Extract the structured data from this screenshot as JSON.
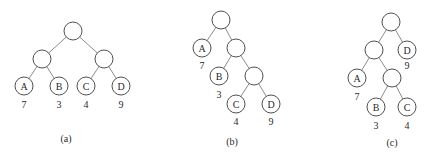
{
  "node_radius": 9,
  "trees": [
    {
      "id": "a",
      "caption": "(a)",
      "caption_pos": [
        66,
        138
      ],
      "nodes": [
        {
          "id": "a-root",
          "x": 73,
          "y": 31,
          "label": ""
        },
        {
          "id": "a-l",
          "x": 42,
          "y": 59,
          "label": ""
        },
        {
          "id": "a-r",
          "x": 104,
          "y": 59,
          "label": ""
        },
        {
          "id": "a-A",
          "x": 24,
          "y": 86,
          "label": "A",
          "weight": "7",
          "wx": 24,
          "wy": 104
        },
        {
          "id": "a-B",
          "x": 59,
          "y": 86,
          "label": "B",
          "weight": "3",
          "wx": 59,
          "wy": 104
        },
        {
          "id": "a-C",
          "x": 86,
          "y": 86,
          "label": "C",
          "weight": "4",
          "wx": 86,
          "wy": 104
        },
        {
          "id": "a-D",
          "x": 121,
          "y": 86,
          "label": "D",
          "weight": "9",
          "wx": 121,
          "wy": 104
        }
      ],
      "edges": [
        [
          "a-root",
          "a-l"
        ],
        [
          "a-root",
          "a-r"
        ],
        [
          "a-l",
          "a-A"
        ],
        [
          "a-l",
          "a-B"
        ],
        [
          "a-r",
          "a-C"
        ],
        [
          "a-r",
          "a-D"
        ]
      ]
    },
    {
      "id": "b",
      "caption": "(b)",
      "caption_pos": [
        232,
        141
      ],
      "nodes": [
        {
          "id": "b-root",
          "x": 221,
          "y": 20,
          "label": ""
        },
        {
          "id": "b-A",
          "x": 202,
          "y": 48,
          "label": "A",
          "weight": "7",
          "wx": 202,
          "wy": 65
        },
        {
          "id": "b-i1",
          "x": 236,
          "y": 48,
          "label": ""
        },
        {
          "id": "b-B",
          "x": 219,
          "y": 76,
          "label": "B",
          "weight": "3",
          "wx": 219,
          "wy": 94
        },
        {
          "id": "b-i2",
          "x": 254,
          "y": 76,
          "label": ""
        },
        {
          "id": "b-C",
          "x": 236,
          "y": 104,
          "label": "C",
          "weight": "4",
          "wx": 236,
          "wy": 121
        },
        {
          "id": "b-D",
          "x": 271,
          "y": 104,
          "label": "D",
          "weight": "9",
          "wx": 271,
          "wy": 121
        }
      ],
      "edges": [
        [
          "b-root",
          "b-A"
        ],
        [
          "b-root",
          "b-i1"
        ],
        [
          "b-i1",
          "b-B"
        ],
        [
          "b-i1",
          "b-i2"
        ],
        [
          "b-i2",
          "b-C"
        ],
        [
          "b-i2",
          "b-D"
        ]
      ]
    },
    {
      "id": "c",
      "caption": "(c)",
      "caption_pos": [
        392,
        142
      ],
      "nodes": [
        {
          "id": "c-root",
          "x": 391,
          "y": 22,
          "label": ""
        },
        {
          "id": "c-i1",
          "x": 374,
          "y": 50,
          "label": ""
        },
        {
          "id": "c-D",
          "x": 407,
          "y": 50,
          "label": "D",
          "weight": "9",
          "wx": 407,
          "wy": 65
        },
        {
          "id": "c-A",
          "x": 357,
          "y": 78,
          "label": "A",
          "weight": "7",
          "wx": 357,
          "wy": 96
        },
        {
          "id": "c-i2",
          "x": 392,
          "y": 78,
          "label": ""
        },
        {
          "id": "c-B",
          "x": 376,
          "y": 107,
          "label": "B",
          "weight": "3",
          "wx": 376,
          "wy": 125
        },
        {
          "id": "c-C",
          "x": 407,
          "y": 107,
          "label": "C",
          "weight": "4",
          "wx": 407,
          "wy": 125
        }
      ],
      "edges": [
        [
          "c-root",
          "c-i1"
        ],
        [
          "c-root",
          "c-D"
        ],
        [
          "c-i1",
          "c-A"
        ],
        [
          "c-i1",
          "c-i2"
        ],
        [
          "c-i2",
          "c-B"
        ],
        [
          "c-i2",
          "c-C"
        ]
      ]
    }
  ]
}
